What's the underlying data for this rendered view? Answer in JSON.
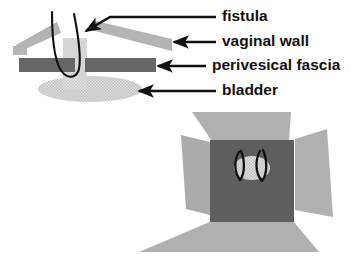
{
  "figure": {
    "panels": [
      {
        "name": "sagittal-cross-section",
        "description": "Side cut-away view of fistula tract passing through vaginal wall, perivesical fascia and bladder"
      },
      {
        "name": "en-face-surgical-view",
        "description": "Face-on view of retracted vaginal wall flaps exposing perivesical fascia, fistula opening and sutures"
      }
    ]
  },
  "labels": [
    {
      "id": "fistula",
      "text": "fistula",
      "x": 222,
      "y": 17,
      "leader": {
        "x1": 153,
        "y1": 17,
        "x2": 216,
        "y2": 17
      },
      "arrow": {
        "tip_x": 84,
        "tip_y": 32,
        "from_x": 150,
        "from_y": 17
      }
    },
    {
      "id": "vaginal-wall",
      "text": "vaginal wall",
      "x": 222,
      "y": 42,
      "leader": {
        "x1": 216,
        "y1": 42,
        "x2": 348,
        "y2": 42
      },
      "arrow": {
        "tip_x": 172,
        "tip_y": 42,
        "from_x": 216,
        "from_y": 42
      }
    },
    {
      "id": "perivesical-fascia",
      "text": "perivesical fascia",
      "x": 212,
      "y": 66,
      "leader": {
        "x1": 206,
        "y1": 66,
        "x2": 348,
        "y2": 66
      },
      "arrow": {
        "tip_x": 156,
        "tip_y": 66,
        "from_x": 206,
        "from_y": 66
      }
    },
    {
      "id": "bladder",
      "text": "bladder",
      "x": 222,
      "y": 91,
      "leader": {
        "x1": 216,
        "y1": 91,
        "x2": 348,
        "y2": 91
      },
      "arrow": {
        "tip_x": 137,
        "tip_y": 91,
        "from_x": 216,
        "from_y": 91
      }
    }
  ],
  "colors": {
    "vaginal_wall": "#b4b4b4",
    "vaginal_wall_lower": "#b0b0b0",
    "perivesical_fascia": "#666666",
    "perivesical_fascia_square": "#5e5e5e",
    "bladder": "#d9d9d9",
    "fistula_opening": "#d4d4d4",
    "fistula_tract": "#d0d0d0",
    "suture": "#111111",
    "arrow": "#111111",
    "text": "#111111",
    "background": "#ffffff"
  },
  "geometry": {
    "upper_panel": {
      "bladder_ellipse": {
        "cx": 90,
        "cy": 89,
        "rx": 52,
        "ry": 13
      },
      "fascia_bar_left": {
        "x": 19,
        "y": 58,
        "w": 56,
        "h": 14
      },
      "fascia_bar_right": {
        "x": 85,
        "y": 58,
        "w": 71,
        "h": 14
      },
      "tract_channel": {
        "x": 63,
        "y": 38,
        "w": 24,
        "h": 52
      },
      "vagina_flap_left": {
        "points": "14,53 17,44 57,23 60,34"
      },
      "vagina_flap_left_base": {
        "x": 14,
        "y": 47,
        "w": 12,
        "h": 8
      },
      "vagina_flap_right": {
        "points": "92,29 97,22 172,40 172,50"
      },
      "fistula_loop": {
        "top_left_x": 52,
        "top_right_x": 75,
        "bottom_y": 76
      }
    },
    "lower_panel": {
      "center_square": {
        "x": 210,
        "y": 140,
        "w": 84,
        "h": 82
      },
      "flap_top": {
        "points": "192,112 290,112 288,140 212,140"
      },
      "flap_left": {
        "points": "182,136 210,142 210,214 186,208"
      },
      "flap_right": {
        "points": "294,138 326,130 332,216 294,210"
      },
      "flap_bottom": {
        "points": "212,222 292,222 318,252 140,252"
      },
      "fistula_opening": {
        "cx": 252,
        "cy": 168,
        "rx": 18,
        "ry": 12
      },
      "sutures": [
        {
          "id": "suture-left",
          "top_x": 240,
          "bottom_y": 182
        },
        {
          "id": "suture-right",
          "top_x": 262,
          "bottom_y": 182
        }
      ]
    }
  }
}
